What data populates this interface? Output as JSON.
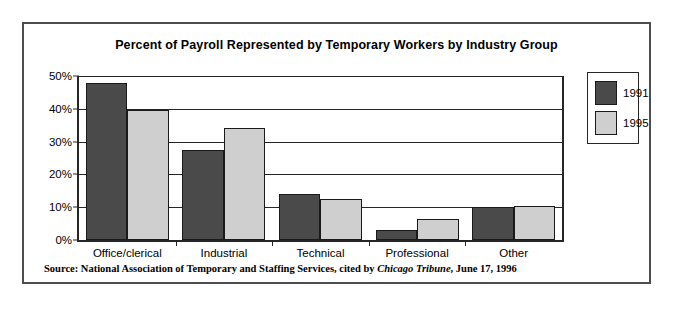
{
  "chart_data": {
    "type": "bar",
    "title": "Percent of Payroll Represented by Temporary Workers by Industry Group",
    "xlabel": "",
    "ylabel": "",
    "categories": [
      "Office/clerical",
      "Industrial",
      "Technical",
      "Professional",
      "Other"
    ],
    "series": [
      {
        "name": "1991",
        "color": "#4a4a4a",
        "values": [
          48,
          27.5,
          14,
          3,
          10
        ]
      },
      {
        "name": "1995",
        "color": "#cfcfcf",
        "values": [
          39.5,
          34,
          12.5,
          6.5,
          10.5
        ]
      }
    ],
    "ylim": [
      0,
      50
    ],
    "yticks": [
      0,
      10,
      20,
      30,
      40,
      50
    ],
    "ytick_labels": [
      "0%",
      "10%",
      "20%",
      "30%",
      "40%",
      "50%"
    ],
    "grid": true,
    "legend_position": "right-outside"
  },
  "source_note": {
    "prefix": "Source: National Association of Temporary and Staffing Services, cited by ",
    "italic": "Chicago Tribune",
    "suffix": ", June 17, 1996"
  }
}
